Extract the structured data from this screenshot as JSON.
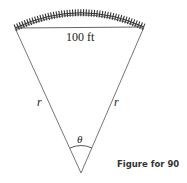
{
  "figure": {
    "chord_label": "100 ft",
    "left_side_label": "r",
    "right_side_label": "r",
    "angle_label": "θ",
    "caption": "Figure for 90"
  },
  "colors": {
    "line": "#555555",
    "track": "#333333"
  }
}
